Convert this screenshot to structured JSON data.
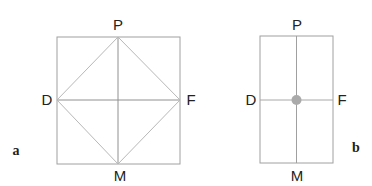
{
  "panels": {
    "a": {
      "label": "a",
      "points": {
        "top": "P",
        "left": "D",
        "right": "F",
        "bottom": "M"
      }
    },
    "b": {
      "label": "b",
      "points": {
        "top": "P",
        "left": "D",
        "right": "F",
        "bottom": "M"
      }
    }
  },
  "colors": {
    "frame": "#9a9a9a",
    "diamond": "#b8b8b8",
    "dot": "#aaaaaa"
  }
}
